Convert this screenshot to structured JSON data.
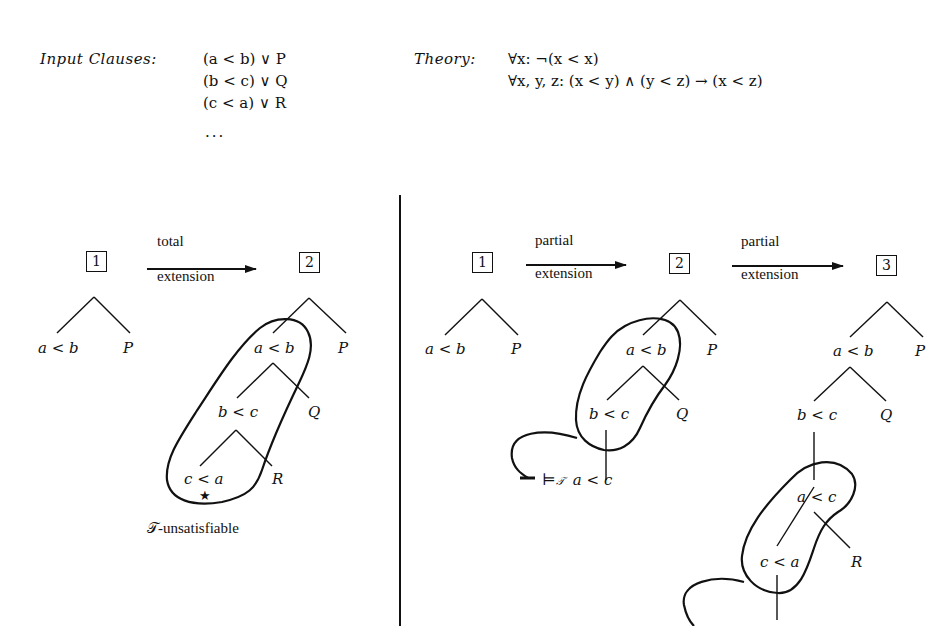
{
  "header": {
    "input_label": "Input Clauses:",
    "clauses": [
      "(a < b) ∨ P",
      "(b < c) ∨ Q",
      "(c < a) ∨ R",
      "..."
    ],
    "theory_label": "Theory:",
    "axioms": [
      "∀x: ¬(x < x)",
      "∀x, y, z: (x < y) ∧ (y < z) → (x < z)"
    ]
  },
  "left_panel": {
    "steps": [
      {
        "id": "1",
        "nodes": [
          "a < b",
          "P"
        ]
      },
      {
        "id": "2",
        "nodes": [
          "a < b",
          "P",
          "b < c",
          "Q",
          "c < a",
          "R"
        ],
        "closed_marker": "★"
      }
    ],
    "arrow": {
      "top": "total",
      "bottom": "extension"
    },
    "conflict_note": "𝒯-unsatisfiable"
  },
  "right_panel": {
    "steps": [
      {
        "id": "1",
        "nodes": [
          "a < b",
          "P"
        ]
      },
      {
        "id": "2",
        "nodes": [
          "a < b",
          "P",
          "b < c",
          "Q"
        ],
        "entailment": "⊨𝒯 a < c"
      },
      {
        "id": "3",
        "nodes": [
          "a < b",
          "P",
          "b < c",
          "Q",
          "a < c",
          "c < a",
          "R"
        ]
      }
    ],
    "arrows": [
      {
        "top": "partial",
        "bottom": "extension"
      },
      {
        "top": "partial",
        "bottom": "extension"
      }
    ],
    "entails_symbol": "⊨",
    "entails_subscript": "𝒯",
    "entailed_literal": "a < c"
  }
}
